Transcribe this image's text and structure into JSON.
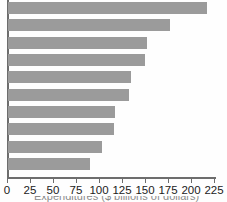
{
  "chart_data": {
    "type": "bar",
    "orientation": "horizontal",
    "title": "",
    "subtitle": "",
    "xlabel": "",
    "ylabel": "",
    "categories": [
      "",
      "",
      "",
      "",
      "",
      "",
      "",
      "",
      "",
      ""
    ],
    "values": [
      216,
      176,
      151,
      149,
      134,
      131,
      116,
      115,
      102,
      89
    ],
    "series": [
      {
        "name": "",
        "values": [
          216,
          176,
          151,
          149,
          134,
          131,
          116,
          115,
          102,
          89
        ]
      }
    ],
    "xlim": [
      0,
      225
    ],
    "xticks": [
      0,
      25,
      50,
      75,
      100,
      125,
      150,
      175,
      200,
      225
    ],
    "xticklabels": [
      "0",
      "25",
      "50",
      "75",
      "100",
      "125",
      "150",
      "175",
      "200",
      "225"
    ],
    "grid": false,
    "legend": false,
    "legend_position": "none",
    "bar_color": "#9b9b9b",
    "axis_color": "#6d6d6d",
    "tick_label_color": "#1b1b1b",
    "background_color": "#ffffff",
    "annotations": []
  },
  "axis": {
    "x_min": 0,
    "x_max": 225,
    "tick_step": 25,
    "origin_px": 7,
    "px_per_unit": 0.92
  },
  "caption": {
    "cropped_text": "Expenditures ($ billions of dollars)",
    "visible": "partially cut off at bottom edge"
  }
}
